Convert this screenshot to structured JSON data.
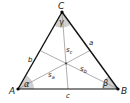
{
  "diagram": {
    "vertices": [
      {
        "id": "A",
        "label": "A"
      },
      {
        "id": "B",
        "label": "B"
      },
      {
        "id": "C",
        "label": "C"
      }
    ],
    "sides": [
      {
        "id": "a",
        "label": "a"
      },
      {
        "id": "b",
        "label": "b"
      },
      {
        "id": "c",
        "label": "c"
      }
    ],
    "angles": [
      {
        "vertex": "A",
        "label": "α"
      },
      {
        "vertex": "B",
        "label": "β"
      },
      {
        "vertex": "C",
        "label": "γ"
      }
    ],
    "medians": [
      {
        "label": "s",
        "subscript": "a"
      },
      {
        "label": "s",
        "subscript": "b"
      },
      {
        "label": "s",
        "subscript": "c"
      }
    ],
    "colors": {
      "side": "#111111",
      "median": "#999999",
      "angle_fill": "#d0d0d0",
      "vertex": "#000000"
    }
  }
}
